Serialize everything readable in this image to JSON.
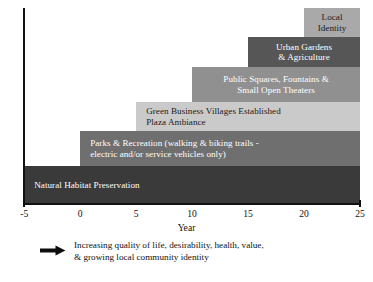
{
  "chart_data": {
    "type": "area",
    "title": "",
    "subtitle": "",
    "xlabel": "Year",
    "ylabel": "",
    "xlim": [
      -5,
      25
    ],
    "ylim": [
      0,
      6
    ],
    "grid": false,
    "legend_position": "none",
    "orientation": "stacked-staircase",
    "xticks": [
      -5,
      0,
      5,
      10,
      15,
      20,
      25
    ],
    "xtick_labels": [
      "-5",
      "0",
      "5",
      "10",
      "15",
      "20",
      "25"
    ],
    "series": [
      {
        "name": "Natural Habitat Preservation",
        "label_lines": [
          "Natural Habitat Preservation"
        ],
        "start_year": -5,
        "end_year": 25,
        "level": 1,
        "fill": "#3a3a3a",
        "text_color": "#ffffff",
        "label_align": "left"
      },
      {
        "name": "Parks & Recreation",
        "label_lines": [
          "Parks & Recreation (walking & biking trails -",
          "electric and/or service vehicles only)"
        ],
        "start_year": 0,
        "end_year": 25,
        "level": 2,
        "fill": "#6f6f6f",
        "text_color": "#ffffff",
        "label_align": "left"
      },
      {
        "name": "Green Business Villages Established",
        "label_lines": [
          "Green Business Villages Established",
          "Plaza Ambiance"
        ],
        "start_year": 5,
        "end_year": 25,
        "level": 3,
        "fill": "#cacaca",
        "text_color": "#1a1a1a",
        "label_align": "left"
      },
      {
        "name": "Public Squares, Fountains & Small Open Theaters",
        "label_lines": [
          "Public Squares, Fountains &",
          "Small Open Theaters"
        ],
        "start_year": 10,
        "end_year": 25,
        "level": 4,
        "fill": "#909090",
        "text_color": "#ffffff",
        "label_align": "center"
      },
      {
        "name": "Urban Gardens & Agriculture",
        "label_lines": [
          "Urban Gardens",
          "& Agriculture"
        ],
        "start_year": 15,
        "end_year": 25,
        "level": 5,
        "fill": "#565656",
        "text_color": "#ffffff",
        "label_align": "center"
      },
      {
        "name": "Local Identity",
        "label_lines": [
          "Local",
          "Identity"
        ],
        "start_year": 20,
        "end_year": 25,
        "level": 6,
        "fill": "#a9a9a9",
        "text_color": "#1a1a1a",
        "label_align": "center"
      }
    ]
  },
  "axis": {
    "x_label": "Year",
    "ticks": [
      {
        "value": "-5"
      },
      {
        "value": "0"
      },
      {
        "value": "5"
      },
      {
        "value": "10"
      },
      {
        "value": "15"
      },
      {
        "value": "20"
      },
      {
        "value": "25"
      }
    ]
  },
  "bands": [
    {
      "id": "local-identity",
      "lines": [
        "Local",
        "Identity"
      ]
    },
    {
      "id": "urban-gardens",
      "lines": [
        "Urban Gardens",
        "& Agriculture"
      ]
    },
    {
      "id": "public-squares",
      "lines": [
        "Public Squares, Fountains &",
        "Small Open Theaters"
      ]
    },
    {
      "id": "green-business",
      "lines": [
        "Green Business Villages Established",
        "Plaza Ambiance"
      ]
    },
    {
      "id": "parks-recreation",
      "lines": [
        "Parks & Recreation (walking & biking trails -",
        "electric and/or service vehicles only)"
      ]
    },
    {
      "id": "natural-habitat",
      "lines": [
        "Natural Habitat Preservation"
      ]
    }
  ],
  "caption": {
    "arrow_icon": "arrow-right-icon",
    "lines": [
      "Increasing quality of life, desirability, health, value,",
      "& growing local community identity"
    ]
  },
  "colors": {
    "axis": "#111111",
    "band_1_natural_habitat": "#3a3a3a",
    "band_2_parks": "#6f6f6f",
    "band_3_green_business": "#cacaca",
    "band_4_public_squares": "#909090",
    "band_5_urban_gardens": "#565656",
    "band_6_local_identity": "#a9a9a9",
    "text_light": "#ffffff",
    "text_dark": "#1a1a1a",
    "background": "#ffffff"
  }
}
